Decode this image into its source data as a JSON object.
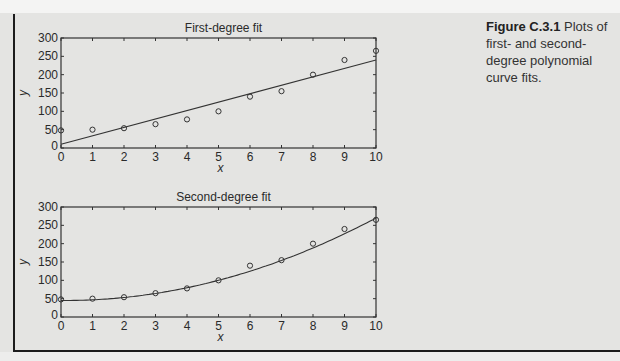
{
  "caption": {
    "figure_label": "Figure C.3.1",
    "text": " Plots of first- and second-degree polynomial curve fits."
  },
  "chart_data": [
    {
      "type": "scatter",
      "title": "First-degree fit",
      "xlabel": "x",
      "ylabel": "y",
      "xlim": [
        0,
        10
      ],
      "ylim": [
        0,
        300
      ],
      "xticks": [
        "0",
        "1",
        "2",
        "3",
        "4",
        "5",
        "6",
        "7",
        "8",
        "9",
        "10"
      ],
      "yticks": [
        "0",
        "50",
        "100",
        "150",
        "200",
        "250",
        "300"
      ],
      "grid": false,
      "series": [
        {
          "name": "data",
          "marker": "circle",
          "x": [
            0,
            1,
            2,
            3,
            4,
            5,
            6,
            7,
            8,
            9,
            10
          ],
          "y": [
            48,
            50,
            54,
            65,
            78,
            100,
            140,
            155,
            200,
            240,
            265
          ]
        },
        {
          "name": "linear fit",
          "style": "line",
          "x": [
            0,
            10
          ],
          "y": [
            10,
            240
          ]
        }
      ]
    },
    {
      "type": "scatter",
      "title": "Second-degree fit",
      "xlabel": "x",
      "ylabel": "y",
      "xlim": [
        0,
        10
      ],
      "ylim": [
        0,
        300
      ],
      "xticks": [
        "0",
        "1",
        "2",
        "3",
        "4",
        "5",
        "6",
        "7",
        "8",
        "9",
        "10"
      ],
      "yticks": [
        "0",
        "50",
        "100",
        "150",
        "200",
        "250",
        "300"
      ],
      "grid": false,
      "series": [
        {
          "name": "data",
          "marker": "circle",
          "x": [
            0,
            1,
            2,
            3,
            4,
            5,
            6,
            7,
            8,
            9,
            10
          ],
          "y": [
            48,
            50,
            54,
            65,
            78,
            100,
            140,
            155,
            200,
            240,
            265
          ]
        },
        {
          "name": "quadratic fit",
          "style": "line",
          "coeffs": {
            "a": 2.3,
            "b": -0.5,
            "c": 45
          }
        }
      ]
    }
  ]
}
